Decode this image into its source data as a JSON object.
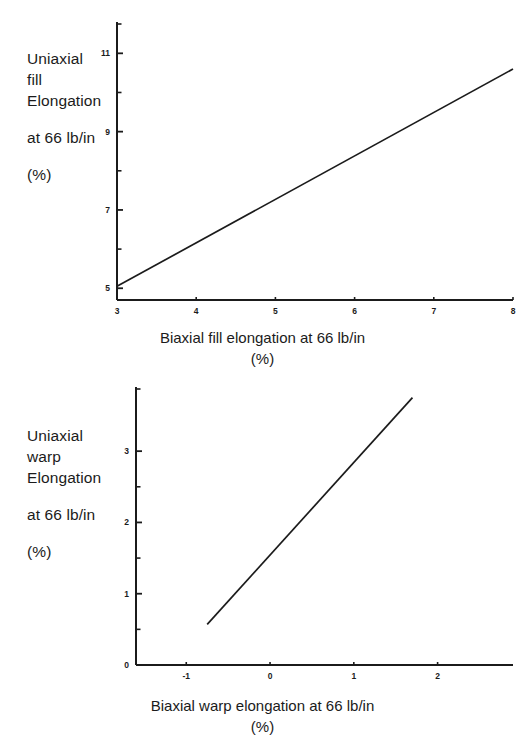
{
  "page": {
    "background_color": "#ffffff",
    "ink_color": "#1b1b1b",
    "width": 525,
    "height": 749
  },
  "figures": [
    {
      "id": "fill-chart",
      "y_axis_label_lines": [
        "Uniaxial",
        "fill",
        "Elongation",
        "at 66 lb/in",
        "(%)"
      ],
      "x_caption": "Biaxial fill elongation at 66 lb/in",
      "x_caption_unit": "(%)",
      "chart_data": {
        "type": "line",
        "title": "",
        "xlabel": "Biaxial fill elongation at 66 lb/in (%)",
        "ylabel": "Uniaxial fill Elongation at 66 lb/in (%)",
        "xlim": [
          3,
          8
        ],
        "ylim": [
          4.7,
          11.8
        ],
        "xticks": [
          3,
          4,
          5,
          6,
          7,
          8
        ],
        "xtick_labels": [
          "3",
          "4",
          "5",
          "6",
          "7",
          "8"
        ],
        "yticks": [
          5,
          7,
          9,
          11
        ],
        "ytick_labels": [
          "5",
          "7",
          "9",
          "11"
        ],
        "y_minor_ticks": [
          6,
          8,
          10
        ],
        "grid": false,
        "legend": false,
        "series": [
          {
            "name": "uniaxial fill elongation",
            "x": [
              3,
              8
            ],
            "values": [
              5.05,
              10.6
            ]
          }
        ]
      }
    },
    {
      "id": "warp-chart",
      "y_axis_label_lines": [
        "Uniaxial",
        "warp",
        "Elongation",
        "at 66 lb/in",
        "(%)"
      ],
      "x_caption": "Biaxial warp elongation at 66 lb/in",
      "x_caption_unit": "(%)",
      "chart_data": {
        "type": "line",
        "title": "",
        "xlabel": "Biaxial warp elongation at 66 lb/in (%)",
        "ylabel": "Uniaxial warp Elongation at 66 lb/in (%)",
        "xlim": [
          -1.6,
          2.9
        ],
        "ylim": [
          0,
          3.9
        ],
        "xticks": [
          -1,
          0,
          1,
          2
        ],
        "xtick_labels": [
          "-1",
          "0",
          "1",
          "2"
        ],
        "yticks": [
          0,
          1,
          2,
          3
        ],
        "ytick_labels": [
          "0",
          "1",
          "2",
          "3"
        ],
        "y_minor_ticks": [
          0.5,
          1.5,
          2.5
        ],
        "grid": false,
        "legend": false,
        "series": [
          {
            "name": "uniaxial warp elongation",
            "x": [
              -0.75,
              1.7
            ],
            "values": [
              0.57,
              3.75
            ]
          }
        ]
      }
    }
  ]
}
